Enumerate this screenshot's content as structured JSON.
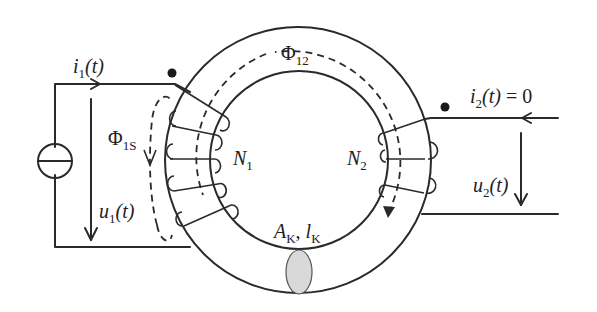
{
  "diagram": {
    "type": "toroidal transformer with two windings",
    "colors": {
      "line": "#2a2a2a",
      "cross_section_fill": "#d9d9d9",
      "background": "#ffffff"
    },
    "core": {
      "label_area": "A",
      "label_area_sub": "K",
      "label_sep": ", ",
      "label_length": "l",
      "label_length_sub": "K"
    },
    "primary": {
      "current_label": "i",
      "current_sub": "1",
      "current_arg": "(t)",
      "voltage_label": "u",
      "voltage_sub": "1",
      "voltage_arg": "(t)",
      "winding_label": "N",
      "winding_sub": "1",
      "leakage_flux_label": "Φ",
      "leakage_flux_sub": "1S",
      "source": "current-source"
    },
    "secondary": {
      "current_label": "i",
      "current_sub": "2",
      "current_arg": "(t)",
      "current_value": " = 0",
      "voltage_label": "u",
      "voltage_sub": "2",
      "voltage_arg": "(t)",
      "winding_label": "N",
      "winding_sub": "2"
    },
    "mutual_flux": {
      "label": "Φ",
      "sub": "12"
    }
  }
}
